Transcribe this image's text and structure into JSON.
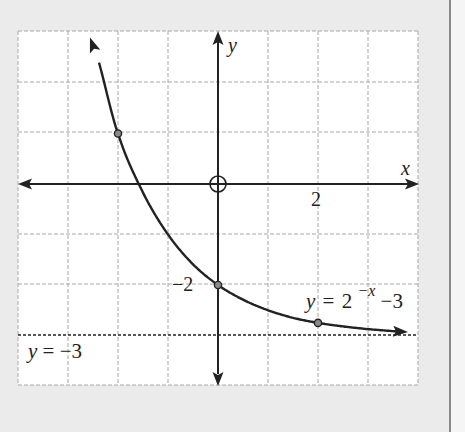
{
  "chart_data": {
    "type": "line",
    "title": "",
    "function_label": "y = 2^(−x) − 3",
    "function_label_parts": {
      "y": "y",
      "eq": "=",
      "base": "2",
      "exp": "−x",
      "tail": "−3"
    },
    "xlabel": "x",
    "ylabel": "y",
    "xlim": [
      -4,
      4
    ],
    "ylim": [
      -4,
      3
    ],
    "grid": true,
    "x_tick_labels": [
      {
        "value": 2,
        "label": "2"
      }
    ],
    "y_tick_labels": [
      {
        "value": -2,
        "label": "−2"
      }
    ],
    "asymptote": {
      "y": -3,
      "label_parts": {
        "y": "y",
        "eq": "=",
        "val": "−3"
      },
      "label": "y=−3",
      "style": "dotted"
    },
    "series": [
      {
        "name": "y = 2^(−x) − 3",
        "x": [
          -2.56,
          -2,
          -1.5,
          -1,
          -0.5,
          0,
          0.5,
          1,
          1.5,
          2,
          2.5,
          3,
          3.8
        ],
        "y": [
          2.9,
          1,
          -0.17,
          -1,
          -1.59,
          -2,
          -2.29,
          -2.5,
          -2.65,
          -2.75,
          -2.82,
          -2.875,
          -2.93
        ]
      }
    ],
    "marked_points": [
      {
        "x": -2,
        "y": 1
      },
      {
        "x": 0,
        "y": -2
      },
      {
        "x": 2,
        "y": -2.75
      }
    ],
    "origin_marker": "open-circle"
  }
}
